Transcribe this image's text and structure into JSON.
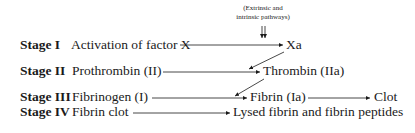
{
  "diagram": {
    "annotation": [
      "(Extrinsic and",
      "intrinsic pathways)"
    ],
    "stages": [
      {
        "label": "Stage I",
        "input": "Activation of factor X",
        "product": "Xa"
      },
      {
        "label": "Stage II",
        "input": "Prothrombin (II)",
        "product": "Thrombin (IIa)"
      },
      {
        "label": "Stage III",
        "input": "Fibrinogen (I)",
        "product": "Fibrin (Ia)",
        "final": "Clot"
      },
      {
        "label": "Stage IV",
        "input": "Fibrin clot",
        "product": "Lysed fibrin and fibrin peptides"
      }
    ]
  }
}
